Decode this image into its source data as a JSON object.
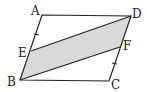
{
  "figure": {
    "type": "parallelogram-diagram",
    "fill_color": "#d9d9d9",
    "stroke_color": "#222222",
    "points": {
      "A": {
        "label": "A",
        "x": 42,
        "y": 15
      },
      "B": {
        "label": "B",
        "x": 20,
        "y": 80
      },
      "C": {
        "label": "C",
        "x": 109,
        "y": 81
      },
      "D": {
        "label": "D",
        "x": 131,
        "y": 16
      },
      "E": {
        "label": "E",
        "x": 31,
        "y": 51
      },
      "F": {
        "label": "F",
        "x": 120,
        "y": 47
      }
    },
    "shaded_region": [
      "E",
      "D",
      "F",
      "B"
    ],
    "tick_marks": [
      "AE",
      "FC"
    ]
  }
}
